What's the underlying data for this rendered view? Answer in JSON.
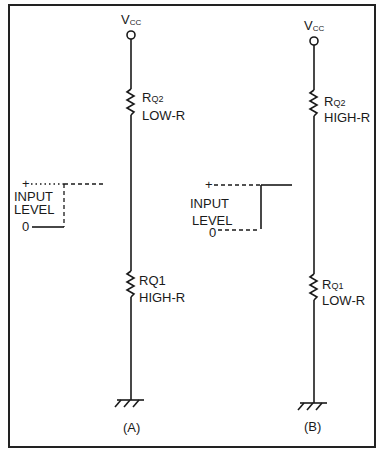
{
  "diagram": {
    "type": "circuit-schematic",
    "panels": [
      {
        "id": "A",
        "caption": "(A)",
        "supply_label": "V",
        "supply_sub": "CC",
        "upper_resistor": {
          "name": "R",
          "sub": "Q2",
          "value_label": "LOW-R"
        },
        "lower_resistor": {
          "name": "RQ1",
          "value_label": "HIGH-R"
        },
        "input": {
          "plus": "+",
          "line1": "INPUT",
          "line2": "LEVEL",
          "zero": "0",
          "state": "low"
        }
      },
      {
        "id": "B",
        "caption": "(B)",
        "supply_label": "V",
        "supply_sub": "CC",
        "upper_resistor": {
          "name": "R",
          "sub": "Q2",
          "value_label": "HIGH-R"
        },
        "lower_resistor": {
          "name": "R",
          "sub": "Q1",
          "value_label": "LOW-R"
        },
        "input": {
          "plus": "+",
          "line1": "INPUT",
          "line2": "LEVEL",
          "zero": "0",
          "state": "high"
        }
      }
    ]
  }
}
